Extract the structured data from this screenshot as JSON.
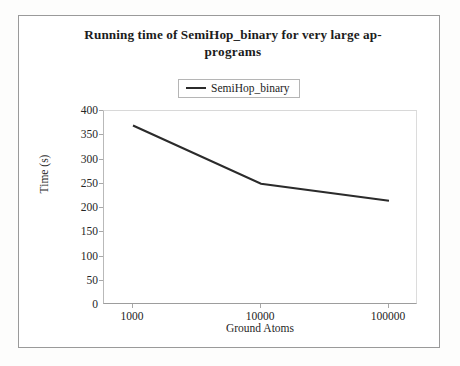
{
  "chart_data": {
    "type": "line",
    "title_lines": [
      "Running time of SemiHop_binary  for very large ap-",
      "programs"
    ],
    "xlabel": "Ground Atoms",
    "ylabel": "Time (s)",
    "categories": [
      "1000",
      "10000",
      "100000"
    ],
    "x_tick_labels": [
      "1000",
      "10000",
      "100000"
    ],
    "y_tick_labels": [
      "400",
      "350",
      "300",
      "250",
      "200",
      "150",
      "100",
      "50",
      "0"
    ],
    "ylim": [
      0,
      400
    ],
    "y_tick_step": 50,
    "grid": false,
    "legend_position": "top-center",
    "series": [
      {
        "name": "SemiHop_binary",
        "values": [
          370,
          250,
          215
        ],
        "color": "#2b2b2b"
      }
    ]
  },
  "legend": {
    "entries": [
      {
        "label": "SemiHop_binary",
        "color": "#2b2b2b"
      }
    ]
  },
  "colors": {
    "line": "#2b2b2b",
    "axis": "#9d9d9d",
    "frame": "#9a9a9a",
    "text": "#1c1c1c",
    "background": "#ffffff"
  }
}
